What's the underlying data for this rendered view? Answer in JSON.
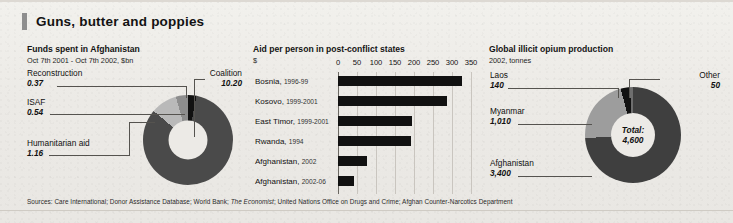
{
  "title": "Guns, butter and poppies",
  "panels": {
    "left": {
      "title": "Funds spent in Afghanistan",
      "subtitle": "Oct 7th 2001 - Oct 7th 2002, $bn",
      "labels": {
        "reconstruction": {
          "name": "Reconstruction",
          "value": "0.37"
        },
        "isaf": {
          "name": "ISAF",
          "value": "0.54"
        },
        "humanitarian": {
          "name": "Humanitarian aid",
          "value": "1.16"
        },
        "coalition": {
          "name": "Coalition",
          "value": "10.20"
        }
      }
    },
    "middle": {
      "title": "Aid per person in post-conflict states",
      "subtitle": "$"
    },
    "right": {
      "title": "Global illicit opium production",
      "subtitle": "2002, tonnes",
      "center_line1": "Total:",
      "center_line2": "4,600",
      "labels": {
        "laos": {
          "name": "Laos",
          "value": "140"
        },
        "myanmar": {
          "name": "Myanmar",
          "value": "1,010"
        },
        "afghanistan": {
          "name": "Afghanistan",
          "value": "3,400"
        },
        "other": {
          "name": "Other",
          "value": "50"
        }
      }
    }
  },
  "chart_data": [
    {
      "type": "pie",
      "title": "Funds spent in Afghanistan",
      "subtitle": "Oct 7th 2001 - Oct 7th 2002, $bn",
      "unit": "$bn",
      "total": 12.27,
      "categories": [
        "Coalition",
        "Humanitarian aid",
        "ISAF",
        "Reconstruction"
      ],
      "values": [
        10.2,
        1.16,
        0.54,
        0.37
      ],
      "colors": [
        "#4a4a4a",
        "#b9b9b9",
        "#8d8d8d",
        "#111111"
      ],
      "legend": "labels-with-leader-lines"
    },
    {
      "type": "bar",
      "orientation": "horizontal",
      "title": "Aid per person in post-conflict states",
      "subtitle": "$",
      "xlabel": "",
      "ylabel": "",
      "xlim": [
        0,
        350
      ],
      "xticks": [
        0,
        50,
        100,
        150,
        200,
        250,
        300,
        350
      ],
      "grid": true,
      "bar_color": "#111111",
      "categories": [
        "Bosnia, 1996-99",
        "Kosovo, 1999-2001",
        "East Timor, 1999-2001",
        "Rwanda, 1994",
        "Afghanistan, 2002",
        "Afghanistan, 2002-06"
      ],
      "category_names": [
        "Bosnia",
        "Kosovo",
        "East Timor",
        "Rwanda",
        "Afghanistan",
        "Afghanistan"
      ],
      "category_years": [
        "1996-99",
        "1999-2001",
        "1999-2001",
        "1994",
        "2002",
        "2002-06"
      ],
      "values": [
        326,
        288,
        195,
        193,
        75,
        42
      ]
    },
    {
      "type": "pie",
      "title": "Global illicit opium production",
      "subtitle": "2002, tonnes",
      "unit": "tonnes",
      "total": 4600,
      "center_label": "Total: 4,600",
      "categories": [
        "Afghanistan",
        "Myanmar",
        "Laos",
        "Other"
      ],
      "values": [
        3400,
        1010,
        140,
        50
      ],
      "colors": [
        "#3f3f3f",
        "#9d9d9d",
        "#111111",
        "#6e6e6e"
      ],
      "legend": "labels-with-leader-lines"
    }
  ],
  "sources": {
    "prefix": "Sources: Care International; Donor Assistance Database; World Bank; ",
    "italic": "The Economist",
    "suffix": "; United Nations Office on Drugs and Crime; Afghan Counter-Narcotics Department"
  }
}
